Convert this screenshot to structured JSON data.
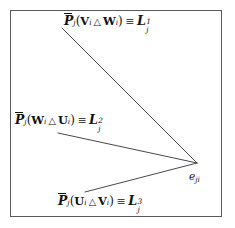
{
  "figure": {
    "type": "diagram",
    "frame": {
      "border_color": "#5a5a5a",
      "background_color": "#ffffff"
    },
    "line_color": "#333333",
    "text_color": "#121212",
    "vertex": {
      "name": "e_ji",
      "base": "e",
      "subscript": "ji",
      "x": 197,
      "y": 163
    },
    "rays": [
      {
        "id": "ray-1",
        "from_x": 62,
        "from_y": 28,
        "to_x": 197,
        "to_y": 163
      },
      {
        "id": "ray-2",
        "from_x": 58,
        "from_y": 133,
        "to_x": 197,
        "to_y": 163
      },
      {
        "id": "ray-3",
        "from_x": 85,
        "from_y": 192,
        "to_x": 197,
        "to_y": 163
      }
    ],
    "labels": [
      {
        "id": "label-ray-1",
        "operator": "P",
        "operator_subscript": "j",
        "open_paren": "(",
        "arg_left": "V",
        "arg_left_subscript": "i",
        "operation": "△",
        "arg_right": "W",
        "arg_right_subscript": "i",
        "close_paren": ")",
        "relation": "≡",
        "result": "L",
        "result_subscript": "j",
        "result_superscript": "1",
        "plain": "P̄_j(V_i △ W_i) ≡ L_j^1"
      },
      {
        "id": "label-ray-2",
        "operator": "P",
        "operator_subscript": "j",
        "open_paren": "(",
        "arg_left": "W",
        "arg_left_subscript": "i",
        "operation": "△",
        "arg_right": "U",
        "arg_right_subscript": "i",
        "close_paren": ")",
        "relation": "≡",
        "result": "L",
        "result_subscript": "j",
        "result_superscript": "2",
        "plain": "P̄_j(W_i △ U_i) ≡ L_j^2"
      },
      {
        "id": "label-ray-3",
        "operator": "P",
        "operator_subscript": "j",
        "open_paren": "(",
        "arg_left": "U",
        "arg_left_subscript": "i",
        "operation": "△",
        "arg_right": "V",
        "arg_right_subscript": "i",
        "close_paren": ")",
        "relation": "≡",
        "result": "L",
        "result_subscript": "j",
        "result_superscript": "3",
        "plain": "P̄_j(U_i △ V_i) ≡ L_j^3"
      }
    ]
  }
}
